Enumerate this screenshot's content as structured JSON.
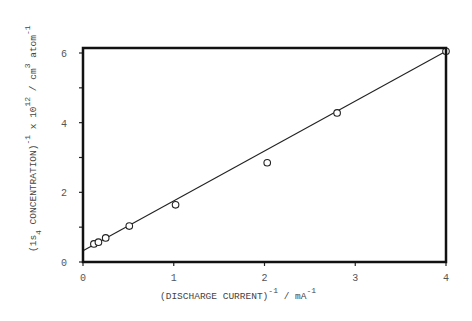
{
  "chart_data": {
    "type": "scatter",
    "title": "",
    "xlabel": "(DISCHARGE CURRENT)^-1 / mA^-1",
    "ylabel": "(1s4 CONCENTRATION)^-1 x 10^12 / cm^3 atom^-1",
    "xlim": [
      0,
      4
    ],
    "ylim": [
      0,
      6.15
    ],
    "x_ticks": [
      "0",
      "1",
      "2",
      "3",
      "4"
    ],
    "y_ticks": [
      "0",
      "2",
      "4",
      "6"
    ],
    "y_minor_ticks": [
      1,
      3,
      5
    ],
    "grid": false,
    "legend": null,
    "series": [
      {
        "name": "data",
        "marker": "open-circle",
        "x": [
          0.12,
          0.17,
          0.25,
          0.51,
          1.02,
          2.03,
          2.8,
          4.0
        ],
        "y": [
          0.52,
          0.57,
          0.69,
          1.03,
          1.64,
          2.85,
          4.28,
          6.05
        ]
      },
      {
        "name": "linear fit",
        "marker": "line",
        "x": [
          0,
          4
        ],
        "y": [
          0.32,
          6.05
        ]
      }
    ]
  },
  "labels": {
    "x": {
      "main": "(DISCHARGE  CURRENT)",
      "exp1": "-1",
      "unit": " / mA",
      "exp2": "-1"
    },
    "y": {
      "p1": "(1s",
      "sub": "4",
      "p2": "  CONCENTRATION)",
      "exp1": "-1",
      "p3": " x 10",
      "exp2": "12",
      "p4": " / cm",
      "exp3": "3",
      "p5": " atom",
      "exp4": "-1"
    }
  }
}
